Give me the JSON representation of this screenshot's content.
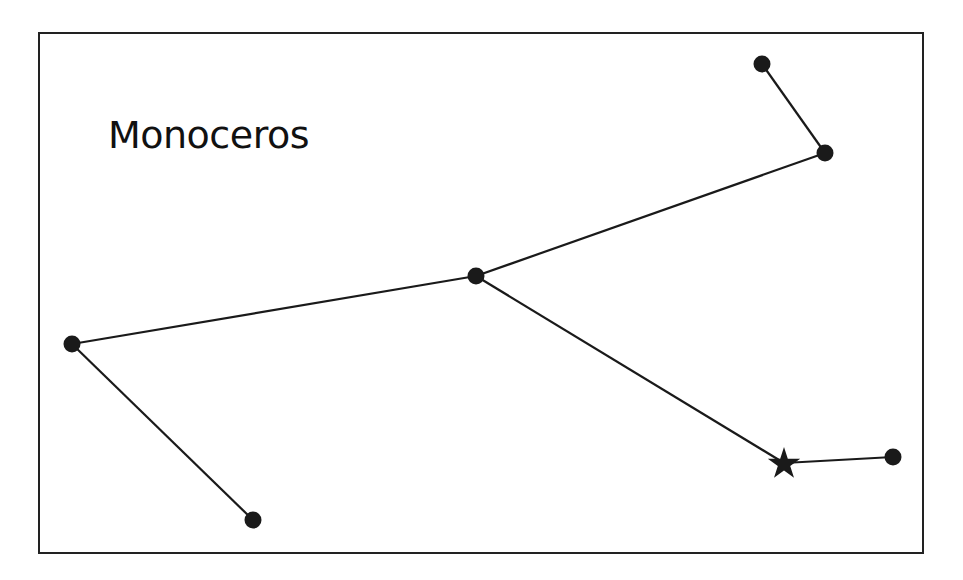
{
  "title": "Monoceros",
  "colors": {
    "line": "#1a1a1a",
    "star_fill": "#1a1a1a",
    "frame": "#222222",
    "background": "#ffffff"
  },
  "stars": [
    {
      "id": "s1",
      "x": 762,
      "y": 64,
      "shape": "dot"
    },
    {
      "id": "s2",
      "x": 825,
      "y": 153,
      "shape": "dot"
    },
    {
      "id": "s3",
      "x": 476,
      "y": 276,
      "shape": "dot"
    },
    {
      "id": "s4",
      "x": 72,
      "y": 344,
      "shape": "dot"
    },
    {
      "id": "s5",
      "x": 253,
      "y": 520,
      "shape": "dot"
    },
    {
      "id": "s6",
      "x": 784,
      "y": 463,
      "shape": "star-marker"
    },
    {
      "id": "s7",
      "x": 893,
      "y": 457,
      "shape": "dot"
    }
  ],
  "connections": [
    [
      "s1",
      "s2"
    ],
    [
      "s2",
      "s3"
    ],
    [
      "s3",
      "s4"
    ],
    [
      "s4",
      "s5"
    ],
    [
      "s3",
      "s6"
    ],
    [
      "s6",
      "s7"
    ]
  ]
}
